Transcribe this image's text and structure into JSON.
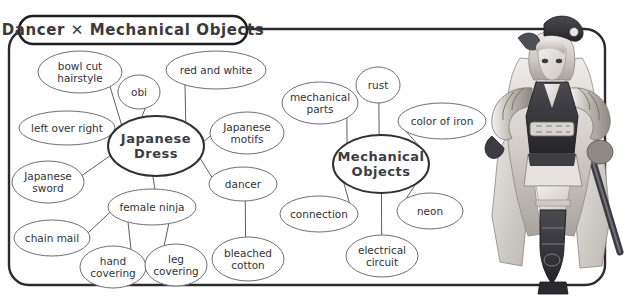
{
  "panel": {
    "title": "Dancer ✕ Mechanical Objects",
    "border_color": "#2b2b2f",
    "background_color": "#ffffff"
  },
  "chart_data": {
    "type": "diagram",
    "subtype": "mind-map",
    "title": "Dancer ✕ Mechanical Objects",
    "hubs": [
      {
        "id": "japanese-dress",
        "label": "Japanese\nDress",
        "label_line1": "Japanese",
        "label_line2": "Dress",
        "cx": 156,
        "cy": 146,
        "rx": 48,
        "ry": 30
      },
      {
        "id": "mechanical-objects",
        "label": "Mechanical\nObjects",
        "label_line1": "Mechanical",
        "label_line2": "Objects",
        "cx": 381,
        "cy": 164,
        "rx": 48,
        "ry": 29
      }
    ],
    "leaves": [
      {
        "id": "bowl-cut-hairstyle",
        "label_line1": "bowl cut",
        "label_line2": "hairstyle",
        "cx": 80,
        "cy": 72,
        "rx": 42,
        "ry": 21,
        "hub": "japanese-dress"
      },
      {
        "id": "obi",
        "label_line1": "obi",
        "label_line2": "",
        "cx": 139,
        "cy": 92,
        "rx": 21,
        "ry": 17,
        "hub": "japanese-dress"
      },
      {
        "id": "red-and-white",
        "label_line1": "red and white",
        "label_line2": "",
        "cx": 216,
        "cy": 70,
        "rx": 50,
        "ry": 19,
        "hub": "japanese-dress"
      },
      {
        "id": "left-over-right",
        "label_line1": "left over right",
        "label_line2": "",
        "cx": 67,
        "cy": 128,
        "rx": 48,
        "ry": 17,
        "hub": "japanese-dress"
      },
      {
        "id": "japanese-motifs",
        "label_line1": "Japanese",
        "label_line2": "motifs",
        "cx": 247,
        "cy": 133,
        "rx": 37,
        "ry": 21,
        "hub": "japanese-dress"
      },
      {
        "id": "japanese-sword",
        "label_line1": "Japanese",
        "label_line2": "sword",
        "cx": 48,
        "cy": 182,
        "rx": 36,
        "ry": 21,
        "hub": "japanese-dress"
      },
      {
        "id": "dancer",
        "label_line1": "dancer",
        "label_line2": "",
        "cx": 243,
        "cy": 184,
        "rx": 34,
        "ry": 17,
        "hub": "japanese-dress"
      },
      {
        "id": "female-ninja",
        "label_line1": "female ninja",
        "label_line2": "",
        "cx": 152,
        "cy": 207,
        "rx": 44,
        "ry": 18,
        "hub": "japanese-dress"
      },
      {
        "id": "chain-mail",
        "label_line1": "chain mail",
        "label_line2": "",
        "cx": 52,
        "cy": 238,
        "rx": 38,
        "ry": 18,
        "hub": "female-ninja"
      },
      {
        "id": "hand-covering",
        "label_line1": "hand",
        "label_line2": "covering",
        "cx": 113,
        "cy": 267,
        "rx": 33,
        "ry": 21,
        "hub": "female-ninja"
      },
      {
        "id": "leg-covering",
        "label_line1": "leg",
        "label_line2": "covering",
        "cx": 176,
        "cy": 265,
        "rx": 31,
        "ry": 21,
        "hub": "female-ninja"
      },
      {
        "id": "bleached-cotton",
        "label_line1": "bleached",
        "label_line2": "cotton",
        "cx": 248,
        "cy": 259,
        "rx": 36,
        "ry": 22,
        "hub": "female-ninja"
      },
      {
        "id": "mechanical-parts",
        "label_line1": "mechanical",
        "label_line2": "parts",
        "cx": 320,
        "cy": 103,
        "rx": 38,
        "ry": 21,
        "hub": "mechanical-objects"
      },
      {
        "id": "rust",
        "label_line1": "rust",
        "label_line2": "",
        "cx": 378,
        "cy": 85,
        "rx": 22,
        "ry": 18,
        "hub": "mechanical-objects"
      },
      {
        "id": "color-of-iron",
        "label_line1": "color of iron",
        "label_line2": "",
        "cx": 442,
        "cy": 121,
        "rx": 44,
        "ry": 18,
        "hub": "mechanical-objects"
      },
      {
        "id": "connection",
        "label_line1": "connection",
        "label_line2": "",
        "cx": 319,
        "cy": 214,
        "rx": 39,
        "ry": 18,
        "hub": "mechanical-objects"
      },
      {
        "id": "neon",
        "label_line1": "neon",
        "label_line2": "",
        "cx": 430,
        "cy": 211,
        "rx": 33,
        "ry": 18,
        "hub": "mechanical-objects"
      },
      {
        "id": "electrical-circuit",
        "label_line1": "electrical",
        "label_line2": "circuit",
        "cx": 382,
        "cy": 256,
        "rx": 36,
        "ry": 21,
        "hub": "mechanical-objects"
      }
    ],
    "edges": [
      {
        "from": "japanese-dress",
        "to": "bowl-cut-hairstyle"
      },
      {
        "from": "japanese-dress",
        "to": "obi"
      },
      {
        "from": "japanese-dress",
        "to": "red-and-white"
      },
      {
        "from": "japanese-dress",
        "to": "left-over-right"
      },
      {
        "from": "japanese-dress",
        "to": "japanese-motifs"
      },
      {
        "from": "japanese-dress",
        "to": "japanese-sword"
      },
      {
        "from": "japanese-dress",
        "to": "dancer"
      },
      {
        "from": "japanese-dress",
        "to": "female-ninja"
      },
      {
        "from": "female-ninja",
        "to": "chain-mail"
      },
      {
        "from": "female-ninja",
        "to": "hand-covering"
      },
      {
        "from": "female-ninja",
        "to": "leg-covering"
      },
      {
        "from": "dancer",
        "to": "bleached-cotton"
      },
      {
        "from": "mechanical-objects",
        "to": "mechanical-parts"
      },
      {
        "from": "mechanical-objects",
        "to": "rust"
      },
      {
        "from": "mechanical-objects",
        "to": "color-of-iron"
      },
      {
        "from": "mechanical-objects",
        "to": "connection"
      },
      {
        "from": "mechanical-objects",
        "to": "neon"
      },
      {
        "from": "mechanical-objects",
        "to": "electrical-circuit"
      }
    ]
  },
  "illustration": {
    "name": "dancer-character-illustration",
    "description": "grayscale anime character, twin-tails, kimono-style dancer outfit with sword"
  }
}
